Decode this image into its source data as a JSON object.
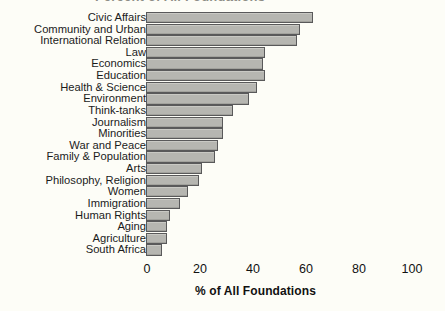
{
  "chart": {
    "title_partial": "Percent of All Foundations",
    "xlabel": "% of  All Foundations",
    "axis_ticks": [
      "0",
      "20",
      "40",
      "60",
      "80",
      "100"
    ],
    "bar_fill_color": "#b6b6b1",
    "bar_border_color": "#59595a",
    "background_color": "#fdfdf7"
  },
  "chart_data": {
    "type": "bar",
    "orientation": "horizontal",
    "title": "",
    "xlabel": "% of  All Foundations",
    "ylabel": "",
    "xlim": [
      0,
      100
    ],
    "xticks": [
      0,
      20,
      40,
      60,
      80,
      100
    ],
    "grid": false,
    "legend": null,
    "categories": [
      "Civic Affairs",
      "Community and Urban",
      "International Relation",
      "Law",
      "Economics",
      "Education",
      "Health & Science",
      "Environment",
      "Think-tanks",
      "Journalism",
      "Minorities",
      "War and Peace",
      "Family & Population",
      "Arts",
      "Philosophy, Religion",
      "Women",
      "Immigration",
      "Human Rights",
      "Aging",
      "Agriculture",
      "South Africa"
    ],
    "values": [
      63,
      58,
      57,
      45,
      44,
      45,
      42,
      39,
      33,
      29,
      29,
      27,
      26,
      21,
      20,
      16,
      13,
      9,
      8,
      8,
      6
    ]
  }
}
